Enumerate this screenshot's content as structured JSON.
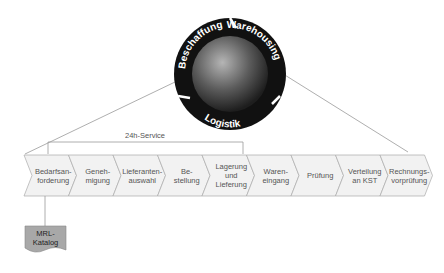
{
  "cycle": {
    "segments": [
      "Beschaffung",
      "Warehousing",
      "Logistik"
    ],
    "ring_color": "#111111",
    "sphere_color": "#5a5a5a"
  },
  "service_bracket": {
    "label": "24h-Service"
  },
  "process_steps": [
    {
      "label": "Bedarfsan-\nforderung"
    },
    {
      "label": "Geneh-\nmigung"
    },
    {
      "label": "Lieferanten-\nauswahl"
    },
    {
      "label": "Be-\nstellung"
    },
    {
      "label": "Lagerung\nund\nLieferung"
    },
    {
      "label": "Waren-\neingang"
    },
    {
      "label": "Prüfung"
    },
    {
      "label": "Verteilung\nan KST"
    },
    {
      "label": "Rechnungs-\nvorprüfung"
    }
  ],
  "document": {
    "label": "MRL-\nKatalog",
    "fill": "#a8a8a8"
  },
  "colors": {
    "chevron_fill": "#f2f2f2",
    "chevron_stroke": "#aaaaaa",
    "line": "#999999"
  }
}
